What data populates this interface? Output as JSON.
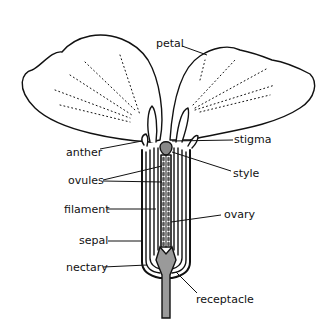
{
  "diagram": {
    "labels": {
      "petal": "petal",
      "stigma": "stigma",
      "anther": "anther",
      "style": "style",
      "ovules": "ovules",
      "filament": "filament",
      "ovary": "ovary",
      "sepal": "sepal",
      "nectary": "nectary",
      "receptacle": "receptacle"
    },
    "colors": {
      "line": "#111111",
      "fill_gray": "#9a9a9a",
      "background": "#ffffff"
    }
  }
}
